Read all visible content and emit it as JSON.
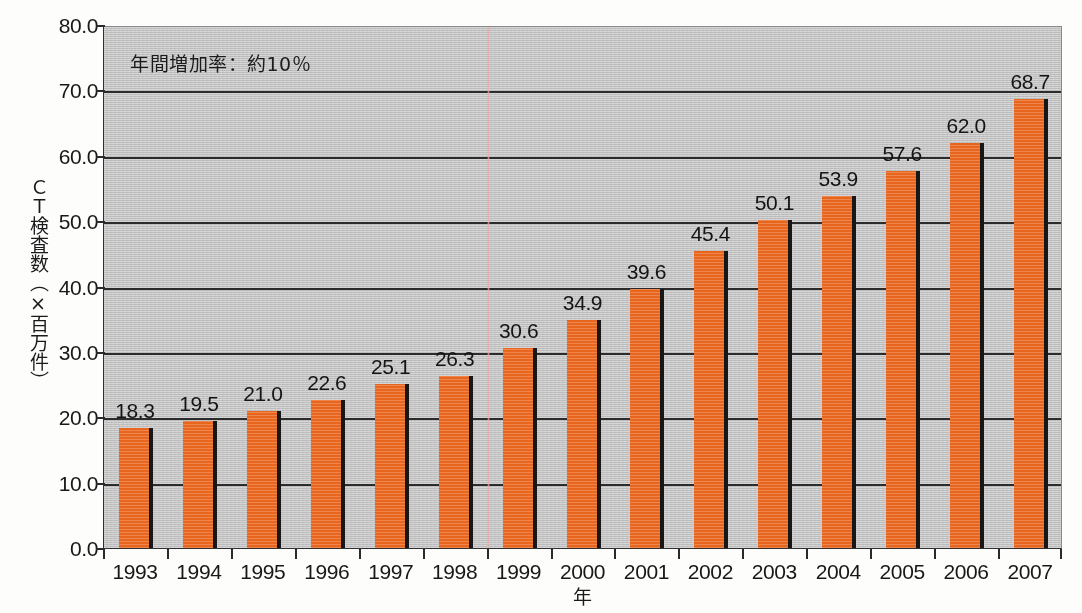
{
  "chart_data": {
    "type": "bar",
    "title": "",
    "xlabel": "年",
    "ylabel": "ＣＴ検査数（×百万件）",
    "categories": [
      "1993",
      "1994",
      "1995",
      "1996",
      "1997",
      "1998",
      "1999",
      "2000",
      "2001",
      "2002",
      "2003",
      "2004",
      "2005",
      "2006",
      "2007"
    ],
    "values": [
      18.3,
      19.5,
      21.0,
      22.6,
      25.1,
      26.3,
      30.6,
      34.9,
      39.6,
      45.4,
      50.1,
      53.9,
      57.6,
      62.0,
      68.7
    ],
    "value_labels": [
      "18.3",
      "19.5",
      "21.0",
      "22.6",
      "25.1",
      "26.3",
      "30.6",
      "34.9",
      "39.6",
      "45.4",
      "50.1",
      "53.9",
      "57.6",
      "62.0",
      "68.7"
    ],
    "ylim": [
      0.0,
      80.0
    ],
    "ytick_values": [
      0.0,
      10.0,
      20.0,
      30.0,
      40.0,
      50.0,
      60.0,
      70.0,
      80.0
    ],
    "ytick_labels": [
      "0.0",
      "10.0",
      "20.0",
      "30.0",
      "40.0",
      "50.0",
      "60.0",
      "70.0",
      "80.0"
    ],
    "grid": true,
    "legend": false,
    "legend_position": "none",
    "annotations": [
      {
        "text": "年間増加率：約10％",
        "x": "1993",
        "y": 76.5
      }
    ],
    "series": [
      {
        "name": "CT検査数",
        "color": "#e8651d",
        "values": [
          18.3,
          19.5,
          21.0,
          22.6,
          25.1,
          26.3,
          30.6,
          34.9,
          39.6,
          45.4,
          50.1,
          53.9,
          57.6,
          62.0,
          68.7
        ]
      }
    ]
  },
  "colors": {
    "bar": "#e8651d",
    "bar_shadow": "#171717",
    "plot_background": "#c6c6c6",
    "gridline": "#2b2b2b",
    "page_background": "#fdfdfc",
    "text": "#181818",
    "scan_artifact": "#eca9a5"
  }
}
